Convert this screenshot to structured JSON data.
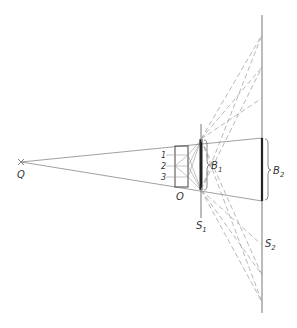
{
  "diagram": {
    "labels": {
      "source": "Q",
      "object": "O",
      "screen1": "S",
      "screen1_sub": "1",
      "screen2": "S",
      "screen2_sub": "2",
      "image1": "B",
      "image1_sub": "1",
      "image2": "B",
      "image2_sub": "2",
      "row1": "1",
      "row2": "2",
      "row3": "3"
    },
    "colors": {
      "line": "#555555",
      "dashed": "#999999",
      "thick": "#222222"
    }
  }
}
